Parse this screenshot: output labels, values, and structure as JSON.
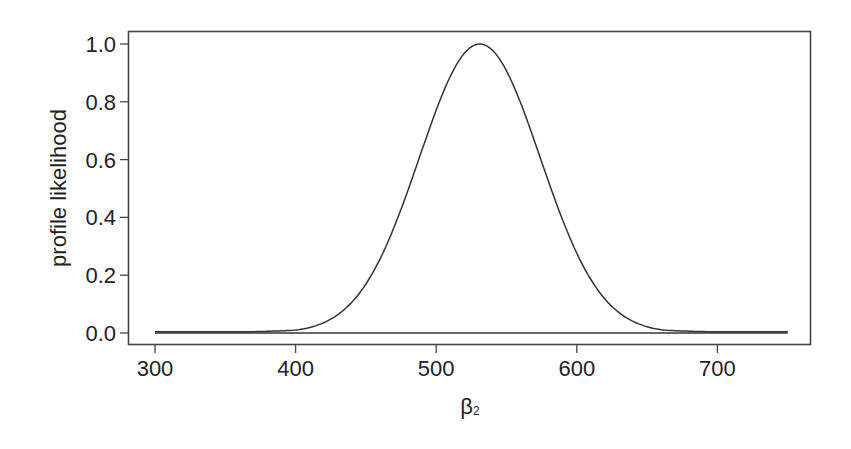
{
  "chart_data": {
    "type": "line",
    "title": "",
    "xlabel": "β₂",
    "xlabel_main": "β",
    "xlabel_sub": "2",
    "ylabel": "profile likelihood",
    "xlim": [
      286,
      772
    ],
    "ylim": [
      -0.04,
      1.04
    ],
    "x_ticks": [
      300,
      400,
      500,
      600,
      700
    ],
    "x_tick_labels": [
      "300",
      "400",
      "500",
      "600",
      "700"
    ],
    "y_ticks": [
      0.0,
      0.2,
      0.4,
      0.6,
      0.8,
      1.0
    ],
    "y_tick_labels": [
      "0.0",
      "0.2",
      "0.4",
      "0.6",
      "0.8",
      "1.0"
    ],
    "grid": false,
    "legend": null,
    "line_color": "#333333",
    "series": [
      {
        "name": "profile likelihood",
        "x": [
          300,
          325,
          350,
          375,
          400,
          420,
          440,
          460,
          480,
          500,
          515,
          531,
          545,
          560,
          580,
          600,
          620,
          640,
          660,
          680,
          700,
          725,
          750
        ],
        "values": [
          0.0,
          0.002,
          0.006,
          0.015,
          0.035,
          0.08,
          0.17,
          0.33,
          0.55,
          0.79,
          0.93,
          1.0,
          0.95,
          0.81,
          0.55,
          0.3,
          0.14,
          0.06,
          0.025,
          0.012,
          0.007,
          0.005,
          0.004
        ]
      },
      {
        "name": "zero baseline",
        "x": [
          300,
          750
        ],
        "values": [
          0.0,
          0.0
        ]
      }
    ],
    "peak": {
      "x": 531,
      "y": 1.0
    }
  }
}
